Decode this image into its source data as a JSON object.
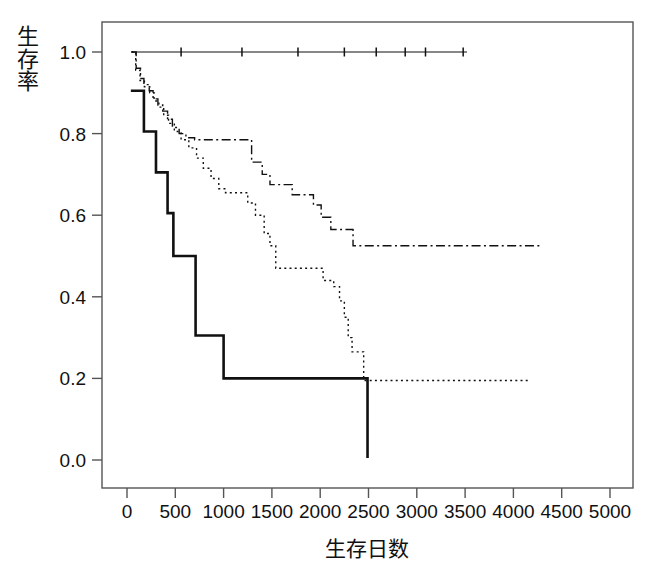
{
  "chart_data": {
    "type": "line",
    "title": "",
    "subtitle": "",
    "xlabel": "生存日数",
    "ylabel": "生存率",
    "xlim": [
      0,
      5200
    ],
    "ylim": [
      -0.03,
      1.05
    ],
    "xticks": [
      0,
      500,
      1000,
      1500,
      2000,
      2500,
      3000,
      3500,
      4000,
      4500,
      5000
    ],
    "xtick_labels": [
      "0",
      "500",
      "1000",
      "1500",
      "2000",
      "2500",
      "3000",
      "3500",
      "4000",
      "4500",
      "5000"
    ],
    "yticks": [
      0.0,
      0.2,
      0.4,
      0.6,
      0.8,
      1.0
    ],
    "ytick_labels": [
      "0.0",
      "0.2",
      "0.4",
      "0.6",
      "0.8",
      "1.0"
    ],
    "grid": false,
    "legend": "none",
    "plot_style": "kaplan-meier step curves",
    "series": [
      {
        "name": "curve-1-solid-flat",
        "linestyle": "solid",
        "color": "#111111",
        "linewidth": 1.2,
        "censor_marks": [
          560,
          1190,
          1770,
          2250,
          2580,
          2880,
          3090,
          3480
        ],
        "points": [
          [
            50,
            1.0
          ],
          [
            3520,
            1.0
          ]
        ]
      },
      {
        "name": "curve-2-dashdot",
        "linestyle": "dashdot",
        "color": "#111111",
        "linewidth": 1.4,
        "points": [
          [
            45,
            1.0
          ],
          [
            95,
            1.0
          ],
          [
            95,
            0.96
          ],
          [
            140,
            0.96
          ],
          [
            140,
            0.935
          ],
          [
            175,
            0.935
          ],
          [
            175,
            0.92
          ],
          [
            230,
            0.92
          ],
          [
            230,
            0.905
          ],
          [
            270,
            0.905
          ],
          [
            270,
            0.885
          ],
          [
            320,
            0.885
          ],
          [
            320,
            0.87
          ],
          [
            370,
            0.87
          ],
          [
            370,
            0.855
          ],
          [
            420,
            0.855
          ],
          [
            420,
            0.835
          ],
          [
            470,
            0.835
          ],
          [
            470,
            0.815
          ],
          [
            540,
            0.815
          ],
          [
            540,
            0.8
          ],
          [
            610,
            0.8
          ],
          [
            610,
            0.79
          ],
          [
            700,
            0.79
          ],
          [
            700,
            0.785
          ],
          [
            1290,
            0.785
          ],
          [
            1290,
            0.73
          ],
          [
            1400,
            0.73
          ],
          [
            1400,
            0.7
          ],
          [
            1480,
            0.7
          ],
          [
            1480,
            0.675
          ],
          [
            1710,
            0.675
          ],
          [
            1710,
            0.65
          ],
          [
            1930,
            0.65
          ],
          [
            1930,
            0.625
          ],
          [
            2010,
            0.625
          ],
          [
            2010,
            0.595
          ],
          [
            2110,
            0.595
          ],
          [
            2110,
            0.565
          ],
          [
            2340,
            0.565
          ],
          [
            2340,
            0.525
          ],
          [
            4300,
            0.525
          ]
        ]
      },
      {
        "name": "curve-3-dotted",
        "linestyle": "dotted",
        "color": "#111111",
        "linewidth": 1.4,
        "points": [
          [
            45,
            1.0
          ],
          [
            90,
            1.0
          ],
          [
            90,
            0.955
          ],
          [
            135,
            0.955
          ],
          [
            135,
            0.93
          ],
          [
            180,
            0.93
          ],
          [
            180,
            0.915
          ],
          [
            235,
            0.915
          ],
          [
            235,
            0.9
          ],
          [
            280,
            0.9
          ],
          [
            280,
            0.88
          ],
          [
            330,
            0.88
          ],
          [
            330,
            0.865
          ],
          [
            380,
            0.865
          ],
          [
            380,
            0.845
          ],
          [
            430,
            0.845
          ],
          [
            430,
            0.825
          ],
          [
            490,
            0.825
          ],
          [
            490,
            0.805
          ],
          [
            560,
            0.805
          ],
          [
            560,
            0.785
          ],
          [
            640,
            0.785
          ],
          [
            640,
            0.765
          ],
          [
            720,
            0.765
          ],
          [
            720,
            0.74
          ],
          [
            790,
            0.74
          ],
          [
            790,
            0.715
          ],
          [
            870,
            0.715
          ],
          [
            870,
            0.69
          ],
          [
            950,
            0.69
          ],
          [
            950,
            0.665
          ],
          [
            1020,
            0.665
          ],
          [
            1020,
            0.655
          ],
          [
            1250,
            0.655
          ],
          [
            1250,
            0.63
          ],
          [
            1330,
            0.63
          ],
          [
            1330,
            0.6
          ],
          [
            1420,
            0.6
          ],
          [
            1420,
            0.555
          ],
          [
            1480,
            0.555
          ],
          [
            1480,
            0.525
          ],
          [
            1540,
            0.525
          ],
          [
            1540,
            0.47
          ],
          [
            2030,
            0.47
          ],
          [
            2030,
            0.44
          ],
          [
            2140,
            0.44
          ],
          [
            2140,
            0.425
          ],
          [
            2200,
            0.425
          ],
          [
            2200,
            0.39
          ],
          [
            2250,
            0.39
          ],
          [
            2250,
            0.35
          ],
          [
            2290,
            0.35
          ],
          [
            2290,
            0.3
          ],
          [
            2330,
            0.3
          ],
          [
            2330,
            0.265
          ],
          [
            2450,
            0.265
          ],
          [
            2450,
            0.195
          ],
          [
            4150,
            0.195
          ]
        ]
      },
      {
        "name": "curve-4-solid-steps",
        "linestyle": "solid",
        "color": "#111111",
        "linewidth": 2.6,
        "points": [
          [
            40,
            0.905
          ],
          [
            175,
            0.905
          ],
          [
            175,
            0.805
          ],
          [
            300,
            0.805
          ],
          [
            300,
            0.705
          ],
          [
            420,
            0.705
          ],
          [
            420,
            0.605
          ],
          [
            480,
            0.605
          ],
          [
            480,
            0.5
          ],
          [
            710,
            0.5
          ],
          [
            710,
            0.305
          ],
          [
            1000,
            0.305
          ],
          [
            1000,
            0.2
          ],
          [
            2490,
            0.2
          ],
          [
            2490,
            0.005
          ]
        ]
      }
    ]
  }
}
